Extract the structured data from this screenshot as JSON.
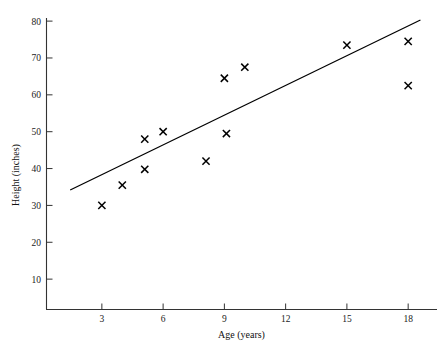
{
  "chart_data": {
    "type": "scatter",
    "title": "",
    "xlabel": "Age (years)",
    "ylabel": "Height (inches)",
    "xlim": [
      0,
      19.8
    ],
    "ylim": [
      0,
      80
    ],
    "xticks": [
      3,
      6,
      9,
      12,
      15,
      18
    ],
    "yticks": [
      10,
      20,
      30,
      40,
      50,
      60,
      70,
      80
    ],
    "grid": false,
    "legend": false,
    "marker": "x",
    "marker_color": "#000000",
    "line_color": "#000000",
    "x": [
      3,
      4,
      5.1,
      5.1,
      6,
      8.1,
      9,
      9.1,
      10,
      15,
      18,
      18
    ],
    "y": [
      30,
      35.5,
      48,
      39.8,
      50,
      42,
      64.5,
      49.5,
      67.5,
      73.5,
      74.5,
      62.5
    ],
    "points": [
      {
        "x": 3,
        "y": 30
      },
      {
        "x": 4,
        "y": 35.5
      },
      {
        "x": 5.1,
        "y": 48
      },
      {
        "x": 5.1,
        "y": 39.8
      },
      {
        "x": 6,
        "y": 50
      },
      {
        "x": 8.1,
        "y": 42
      },
      {
        "x": 9,
        "y": 64.5
      },
      {
        "x": 9.1,
        "y": 49.5
      },
      {
        "x": 10,
        "y": 67.5
      },
      {
        "x": 15,
        "y": 73.5
      },
      {
        "x": 18,
        "y": 74.5
      },
      {
        "x": 18,
        "y": 62.5
      }
    ],
    "trend_line": {
      "name": "least-squares fit",
      "x_start": 1.45,
      "y_start": 34.2,
      "x_end": 18.6,
      "y_end": 80.3
    }
  },
  "axes": {
    "x_tick_labels": [
      "3",
      "6",
      "9",
      "12",
      "15",
      "18"
    ],
    "y_tick_labels": [
      "10",
      "20",
      "30",
      "40",
      "50",
      "60",
      "70",
      "80"
    ],
    "x_axis_title": "Age (years)",
    "y_axis_title": "Height (inches)"
  }
}
